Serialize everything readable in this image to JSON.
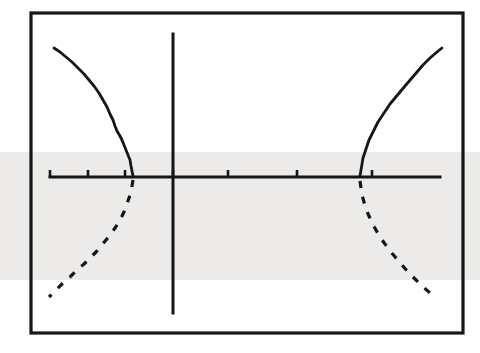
{
  "figure": {
    "title": "",
    "background_color": "#ffffff",
    "ink_color": "#161616",
    "scan_band": {
      "color": "#ecebe9",
      "y_top": 152,
      "y_bottom": 280,
      "label": "scanner-shading-band"
    },
    "frame": {
      "label": "plot-frame-border",
      "x": 31,
      "y": 13,
      "width": 432,
      "height": 320,
      "stroke_width": 3.2
    }
  },
  "chart_data": {
    "type": "line",
    "title": "",
    "subtitle": "",
    "xlabel": "",
    "ylabel": "",
    "grid": false,
    "legend": null,
    "axes": {
      "x_axis": {
        "label": "x-axis",
        "y_pixel": 177,
        "x_start": 50,
        "x_end": 440,
        "stroke_width": 3.0,
        "ticks_pixel_x": [
          50,
          88,
          125,
          173,
          228,
          297,
          372
        ],
        "tick_height": 7
      },
      "y_axis": {
        "label": "y-axis",
        "x_pixel": 173,
        "y_start": 34,
        "y_end": 313,
        "stroke_width": 3.0
      }
    },
    "series": [
      {
        "name": "left-upper-branch",
        "style": "solid",
        "stroke_width": 2.8,
        "points": [
          [
            54,
            48
          ],
          [
            60,
            52
          ],
          [
            66,
            57
          ],
          [
            72,
            62
          ],
          [
            78,
            68
          ],
          [
            84,
            74
          ],
          [
            89,
            80
          ],
          [
            94,
            86
          ],
          [
            99,
            93
          ],
          [
            103,
            100
          ],
          [
            107,
            107
          ],
          [
            110,
            114
          ],
          [
            113,
            120
          ],
          [
            115,
            126
          ],
          [
            117,
            131
          ],
          [
            120,
            136
          ],
          [
            122,
            140
          ],
          [
            124,
            145
          ],
          [
            126,
            150
          ],
          [
            128,
            155
          ],
          [
            130,
            160
          ],
          [
            131,
            166
          ],
          [
            132,
            171
          ],
          [
            133,
            176
          ]
        ]
      },
      {
        "name": "left-lower-branch",
        "style": "dashed",
        "stroke_width": 3.2,
        "dash_pattern": "7 9",
        "points": [
          [
            133,
            180
          ],
          [
            132,
            186
          ],
          [
            131,
            192
          ],
          [
            129,
            198
          ],
          [
            127,
            204
          ],
          [
            125,
            210
          ],
          [
            122,
            216
          ],
          [
            119,
            222
          ],
          [
            115,
            228
          ],
          [
            111,
            234
          ],
          [
            106,
            240
          ],
          [
            101,
            246
          ],
          [
            96,
            252
          ],
          [
            90,
            258
          ],
          [
            84,
            264
          ],
          [
            77,
            270
          ],
          [
            70,
            277
          ],
          [
            62,
            284
          ],
          [
            55,
            291
          ],
          [
            49,
            297
          ]
        ]
      },
      {
        "name": "right-upper-branch",
        "style": "solid",
        "stroke_width": 2.8,
        "points": [
          [
            360,
            176
          ],
          [
            361,
            170
          ],
          [
            362,
            164
          ],
          [
            363,
            158
          ],
          [
            365,
            152
          ],
          [
            367,
            146
          ],
          [
            369,
            140
          ],
          [
            372,
            134
          ],
          [
            375,
            128
          ],
          [
            378,
            122
          ],
          [
            382,
            116
          ],
          [
            386,
            110
          ],
          [
            390,
            104
          ],
          [
            395,
            98
          ],
          [
            400,
            92
          ],
          [
            405,
            86
          ],
          [
            411,
            79
          ],
          [
            417,
            72
          ],
          [
            423,
            65
          ],
          [
            430,
            58
          ],
          [
            437,
            52
          ],
          [
            442,
            48
          ]
        ]
      },
      {
        "name": "right-lower-branch",
        "style": "dashed",
        "stroke_width": 3.2,
        "dash_pattern": "7 9",
        "points": [
          [
            360,
            181
          ],
          [
            361,
            188
          ],
          [
            362,
            195
          ],
          [
            364,
            202
          ],
          [
            366,
            209
          ],
          [
            369,
            216
          ],
          [
            372,
            223
          ],
          [
            376,
            230
          ],
          [
            380,
            237
          ],
          [
            385,
            244
          ],
          [
            390,
            251
          ],
          [
            396,
            258
          ],
          [
            402,
            265
          ],
          [
            408,
            272
          ],
          [
            415,
            279
          ],
          [
            422,
            286
          ],
          [
            429,
            292
          ],
          [
            435,
            297
          ]
        ]
      }
    ],
    "notes": {
      "description": "Symmetric hand-drawn curve pair; solid above axis, dashed below axis, mirrored about the vertical y-axis.",
      "axis_crossings_pixel_x": [
        133,
        360
      ]
    }
  }
}
